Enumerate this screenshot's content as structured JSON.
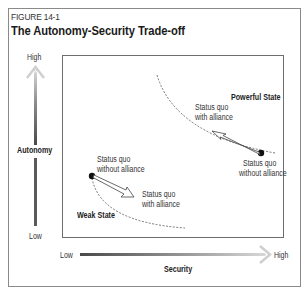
{
  "figure": {
    "label": "FIGURE 14-1",
    "title": "The Autonomy-Security Trade-off"
  },
  "y_axis": {
    "label": "Autonomy",
    "high": "High",
    "low": "Low"
  },
  "x_axis": {
    "label": "Security",
    "low": "Low",
    "high": "High"
  },
  "powerful_state": {
    "title": "Powerful State",
    "start_line1": "Status quo",
    "start_line2": "without alliance",
    "end_line1": "Status quo",
    "end_line2": "with alliance"
  },
  "weak_state": {
    "title": "Weak State",
    "start_line1": "Status quo",
    "start_line2": "without alliance",
    "end_line1": "Status quo",
    "end_line2": "with alliance"
  },
  "colors": {
    "frame": "#8a8a8a",
    "inner_box": "#6d6d6d",
    "arrow_dark": "#555555",
    "arrow_light": "#cfcfcf",
    "text": "#231f20"
  }
}
